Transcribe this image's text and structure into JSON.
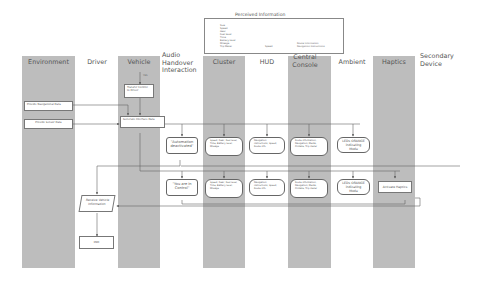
{
  "perceived_information": {
    "title": "Perceived Information",
    "left_list": [
      "Size",
      "Speed",
      "Gear",
      "Fuel level",
      "Time",
      "Battery level",
      "Mileage",
      "Trip Meter"
    ],
    "middle": "Speed",
    "right": [
      "Route Information",
      "Navigation Instructions"
    ]
  },
  "lanes": [
    {
      "label": "Environment",
      "shaded": true
    },
    {
      "label": "Driver",
      "shaded": false
    },
    {
      "label": "Vehicle",
      "shaded": true
    },
    {
      "label": "Audio Handover Interaction",
      "shaded": false
    },
    {
      "label": "Cluster",
      "shaded": true
    },
    {
      "label": "HUD",
      "shaded": false
    },
    {
      "label": "Central Console",
      "shaded": true
    },
    {
      "label": "Ambient",
      "shaded": false
    },
    {
      "label": "Haptics",
      "shaded": true
    },
    {
      "label": "Secondary Device",
      "shaded": false
    }
  ],
  "nodes": {
    "yes_label": "YES",
    "transfer": "Transfer Control to Driver",
    "provide_nav": "Provide Navigational Data",
    "provide_sensor": "Provide Sensor Data",
    "generate_ui": "Generate Interface Data",
    "audio_1": "\"Automation deactivated\"",
    "audio_2": "\"You are in Control\"",
    "cluster_1": "Speed, Gear, Fuel level, Time, Battery level, Mileage",
    "cluster_2": "Speed, Gear, Fuel level, Time, Battery level, Mileage",
    "hud_1": "Navigation instructions, Speed, Route info",
    "hud_2": "Navigation instructions, Speed, Route info",
    "console_1": "Route information, Navigation, Media, Climate, Trip meter",
    "console_2": "Route information, Navigation, Media, Climate, Trip meter",
    "ambient_1": "LEDs ORANGE indicating Mode",
    "ambient_2": "LEDs ORANGE indicating Mode",
    "haptics": "Activate Haptics",
    "receive": "Receive Vehicle Information",
    "end": "END"
  }
}
